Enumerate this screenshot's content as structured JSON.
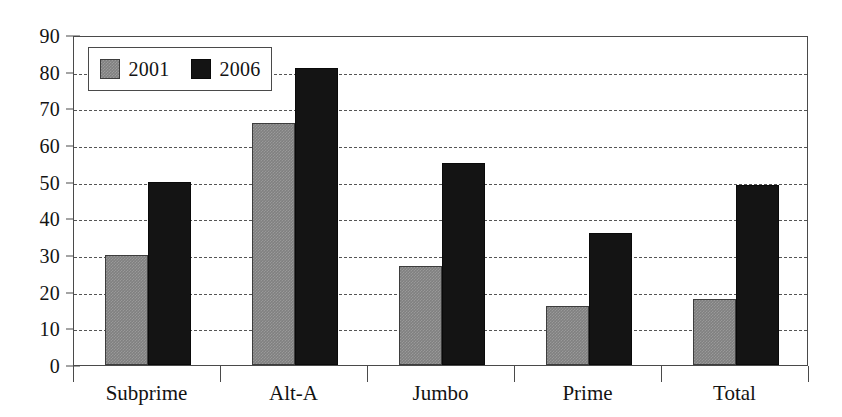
{
  "chart_data": {
    "type": "bar",
    "title": "",
    "subtitle": "",
    "xlabel": "",
    "ylabel": "",
    "categories": [
      "Subprime",
      "Alt-A",
      "Jumbo",
      "Prime",
      "Total"
    ],
    "series": [
      {
        "name": "2001",
        "values": [
          30,
          66,
          27,
          16,
          18
        ],
        "color": "#808080"
      },
      {
        "name": "2006",
        "values": [
          50,
          81,
          55,
          36,
          49
        ],
        "color": "#141414"
      }
    ],
    "ylim": [
      0,
      90
    ],
    "yticks": [
      0,
      10,
      20,
      30,
      40,
      50,
      60,
      70,
      80,
      90
    ],
    "ytick_labels": [
      "0",
      "10",
      "20",
      "30",
      "40",
      "50",
      "60",
      "70",
      "80",
      "90"
    ],
    "grid": true,
    "grid_style": "dashed",
    "grid_axis": "y",
    "legend": {
      "position": "top-left",
      "entries": [
        {
          "label": "2001",
          "swatch": "gray-checker-swatch"
        },
        {
          "label": "2006",
          "swatch": "black-swatch"
        }
      ]
    },
    "frame": true,
    "bar_gap_within_group": 0
  }
}
